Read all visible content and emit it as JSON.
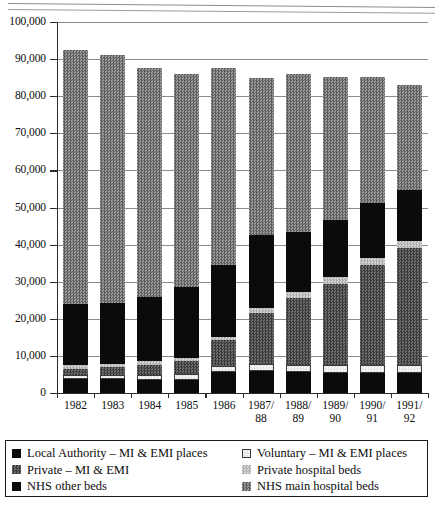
{
  "chart_data": {
    "type": "bar",
    "stacked": true,
    "title": "",
    "subtitle": "",
    "xlabel": "",
    "ylabel": "",
    "ylim": [
      0,
      100000
    ],
    "ytick_labels": [
      "0",
      "10,000",
      "20,000",
      "30,000",
      "40,000",
      "50,000",
      "60,000",
      "70,000",
      "80,000",
      "90,000",
      "100,000"
    ],
    "ytick_values": [
      0,
      10000,
      20000,
      30000,
      40000,
      50000,
      60000,
      70000,
      80000,
      90000,
      100000
    ],
    "grid": true,
    "grid_axis": "y",
    "legend_position": "bottom",
    "categories": [
      "1982",
      "1983",
      "1984",
      "1985",
      "1986",
      "1987/\n88",
      "1988/\n89",
      "1989/\n90",
      "1990/\n91",
      "1991/\n92"
    ],
    "series": [
      {
        "name": "Local Authority – MI & EMI places",
        "pattern": "solid-black",
        "values": [
          3800,
          3700,
          3600,
          3500,
          5700,
          6000,
          5700,
          5500,
          5400,
          5300
        ]
      },
      {
        "name": "Voluntary – MI & EMI places",
        "pattern": "very-light",
        "values": [
          1100,
          1200,
          1300,
          1500,
          1700,
          1800,
          1900,
          2000,
          2100,
          2200
        ]
      },
      {
        "name": "Private – MI & EMI",
        "pattern": "dark-gray-check",
        "values": [
          1700,
          2100,
          2700,
          3500,
          6800,
          13700,
          17900,
          22000,
          27000,
          31500
        ]
      },
      {
        "name": "Private hospital beds",
        "pattern": "light-gray",
        "values": [
          900,
          900,
          900,
          900,
          900,
          1500,
          1600,
          1700,
          1800,
          1900
        ]
      },
      {
        "name": "NHS other beds",
        "pattern": "solid-black-2",
        "values": [
          16500,
          16400,
          17500,
          19100,
          19300,
          19500,
          16300,
          15500,
          14900,
          13800
        ]
      },
      {
        "name": "NHS main hospital beds",
        "pattern": "nhs-main-check",
        "values": [
          68500,
          66700,
          61500,
          57500,
          53100,
          42500,
          42600,
          38600,
          34000,
          28300
        ]
      }
    ],
    "bar_totals": [
      92500,
      91000,
      87500,
      86000,
      87500,
      85000,
      86000,
      85300,
      85200,
      83000
    ]
  },
  "legend": {
    "left_column": [
      {
        "label": "Local Authority – MI & EMI places",
        "swatch": "solid-black"
      },
      {
        "label": "Private – MI & EMI",
        "swatch": "dark-gray-check"
      },
      {
        "label": "NHS other beds",
        "swatch": "solid-black"
      }
    ],
    "right_column": [
      {
        "label": "Voluntary – MI & EMI places",
        "swatch": "very-light"
      },
      {
        "label": "Private hospital beds",
        "swatch": "light-gray"
      },
      {
        "label": "NHS main hospital beds",
        "swatch": "nhs-main-check"
      }
    ]
  },
  "colors": {
    "solid_black": "#0b0b0b",
    "dark_gray": "#5b5b5b",
    "mid_gray": "#8e8e8e",
    "light_gray": "#c3c3c3",
    "very_light": "#f2f2f2",
    "nhs_main": "#7e7e7e",
    "axis": "#2b2b2b",
    "gridline": "#8a8a8a"
  }
}
